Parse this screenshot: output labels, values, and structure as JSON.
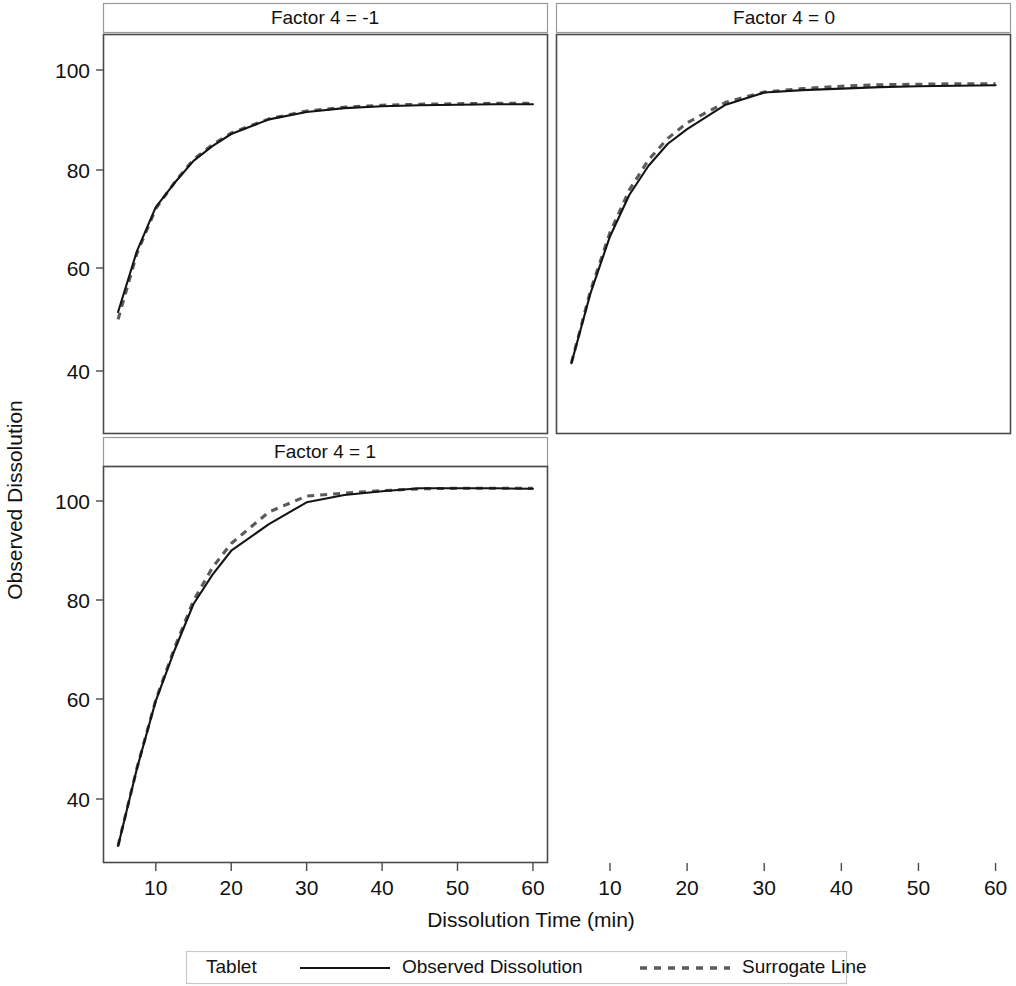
{
  "figure": {
    "axis_titles": {
      "y": "Observed Dissolution",
      "x": "Dissolution Time (min)"
    },
    "legend": {
      "group_label": "Tablet",
      "entries": [
        {
          "label": "Observed Dissolution",
          "style": "solid",
          "color": "#141414"
        },
        {
          "label": "Surrogate Line",
          "style": "dashed",
          "color": "#5b5b5b"
        }
      ]
    },
    "panels": [
      {
        "id": "p1",
        "strip": "Factor 4 = -1",
        "row": 0,
        "col": 0
      },
      {
        "id": "p2",
        "strip": "Factor 4 = 0",
        "row": 0,
        "col": 1
      },
      {
        "id": "p3",
        "strip": "Factor 4 = 1",
        "row": 1,
        "col": 0
      }
    ],
    "empty_panel_row": 1,
    "empty_panel_col": 1
  },
  "chart_data": {
    "type": "line",
    "title": "",
    "subtitle": "",
    "xlabel": "Dissolution Time (min)",
    "ylabel": "Observed Dissolution",
    "xlim": [
      3,
      62
    ],
    "ylim": [
      26,
      108
    ],
    "xticks": [
      10,
      20,
      30,
      40,
      50,
      60
    ],
    "yticks": [
      40,
      60,
      80,
      100
    ],
    "grid": false,
    "legend_position": "bottom",
    "legend_title": "Tablet",
    "facet_variable": "Factor 4",
    "facet_layout": "2x2 (bottom-right panel empty)",
    "panels": [
      {
        "facet_label": "Factor 4 = -1",
        "x": [
          5,
          7.5,
          10,
          12.5,
          15,
          17.5,
          20,
          25,
          30,
          35,
          40,
          45,
          50,
          55,
          60
        ],
        "series": [
          {
            "name": "Observed Dissolution",
            "style": "solid",
            "values": [
              51.0,
              63.5,
              72.5,
              77.5,
              82.0,
              85.0,
              87.5,
              90.5,
              92.0,
              92.8,
              93.2,
              93.4,
              93.5,
              93.6,
              93.6
            ]
          },
          {
            "name": "Surrogate Line",
            "style": "dashed",
            "values": [
              49.5,
              63.0,
              72.2,
              77.6,
              82.3,
              85.3,
              87.7,
              90.6,
              92.2,
              93.0,
              93.4,
              93.6,
              93.7,
              93.8,
              93.8
            ]
          }
        ]
      },
      {
        "facet_label": "Factor 4 = 0",
        "x": [
          5,
          7.5,
          10,
          12.5,
          15,
          17.5,
          20,
          25,
          30,
          35,
          40,
          45,
          50,
          55,
          60
        ],
        "series": [
          {
            "name": "Observed Dissolution",
            "style": "solid",
            "values": [
              40.5,
              55.0,
              66.5,
              75.0,
              81.0,
              85.5,
              88.5,
              93.5,
              96.0,
              96.5,
              96.8,
              97.1,
              97.3,
              97.4,
              97.5
            ]
          },
          {
            "name": "Surrogate Line",
            "style": "dashed",
            "values": [
              40.6,
              55.5,
              67.3,
              76.0,
              82.2,
              86.6,
              89.8,
              94.0,
              96.1,
              96.8,
              97.3,
              97.6,
              97.7,
              97.8,
              97.8
            ]
          }
        ]
      },
      {
        "facet_label": "Factor 4 = 1",
        "x": [
          5,
          7.5,
          10,
          12.5,
          15,
          17.5,
          20,
          25,
          30,
          35,
          40,
          45,
          50,
          55,
          60
        ],
        "series": [
          {
            "name": "Observed Dissolution",
            "style": "solid",
            "values": [
              29.5,
              45.5,
              59.5,
              70.0,
              79.5,
              85.5,
              90.5,
              96.0,
              100.5,
              102.0,
              102.8,
              103.4,
              103.4,
              103.4,
              103.3
            ]
          },
          {
            "name": "Surrogate Line",
            "style": "dashed",
            "values": [
              29.6,
              45.6,
              59.7,
              70.5,
              80.2,
              87.0,
              92.0,
              98.5,
              101.8,
              102.4,
              102.9,
              103.3,
              103.4,
              103.4,
              103.4
            ]
          }
        ]
      }
    ]
  },
  "geometry": {
    "plot_left": 103,
    "plot_right_col0": 548,
    "plot_left_col1": 556,
    "plot_right_col1": 1011,
    "row0_top": 34,
    "row0_bottom": 434,
    "row1_top": 466,
    "row1_bottom": 863,
    "strip_height": 29
  }
}
